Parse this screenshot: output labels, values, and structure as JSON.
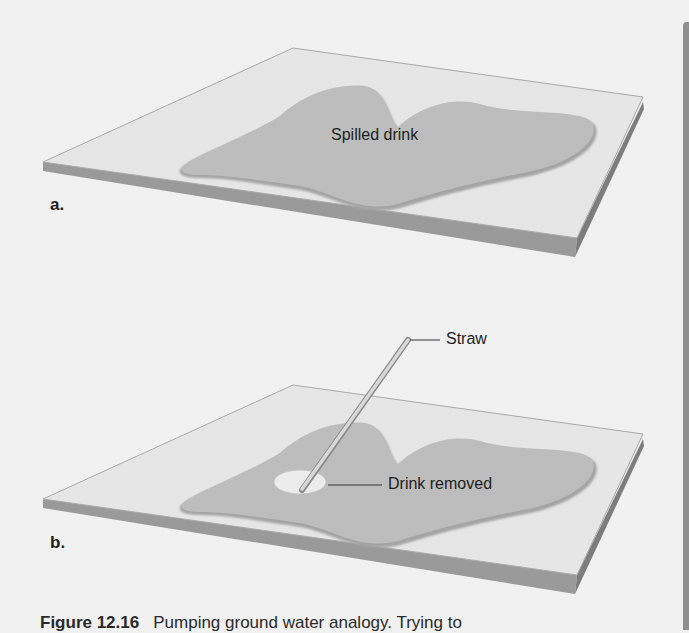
{
  "figure": {
    "panels": [
      {
        "letter": "a.",
        "labels": {
          "pool": "Spilled drink"
        }
      },
      {
        "letter": "b.",
        "labels": {
          "straw": "Straw",
          "removed": "Drink removed"
        }
      }
    ],
    "caption": {
      "number": "Figure 12.16",
      "text": "Pumping ground water analogy. Trying to"
    },
    "colors": {
      "background": "#f1f1f1",
      "plate_top": "#e6e6e6",
      "plate_edge": "#9a9a9a",
      "plate_side": "#7d7d7d",
      "pool": "#bdbdbd",
      "pool_shadow": "#a4a4a4",
      "cleared_spot": "#ececec",
      "straw": "#cfcfcf",
      "text": "#1e1e1e",
      "page_border": "#8f8f8f"
    }
  }
}
